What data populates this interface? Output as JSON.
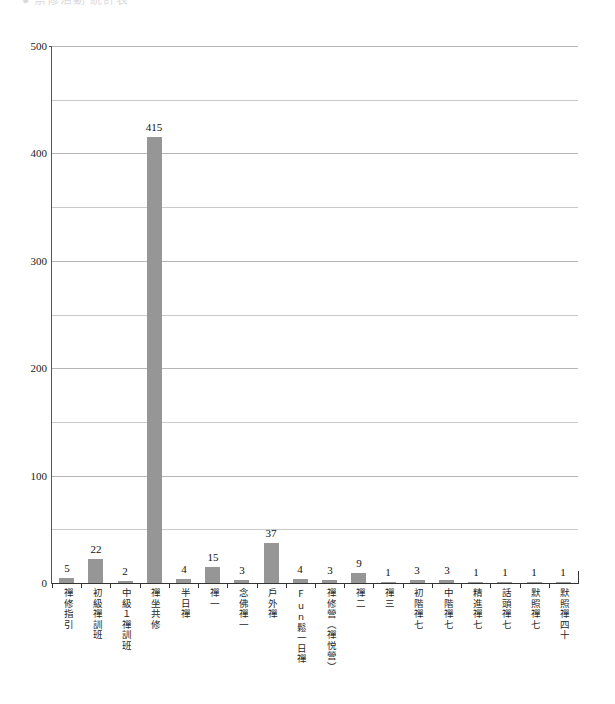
{
  "header": {
    "clipped_text": "● 禁修活動 統計表"
  },
  "chart_data": {
    "type": "bar",
    "title": "",
    "subtitle": "",
    "xlabel": "",
    "ylabel": "",
    "ylim": [
      0,
      500
    ],
    "ytick_labels": [
      "500",
      "400",
      "300",
      "200",
      "100",
      "0"
    ],
    "ytick_values": [
      500,
      400,
      300,
      200,
      100,
      0
    ],
    "gridlines_major": [
      500,
      400,
      300,
      200,
      100
    ],
    "gridlines_minor": [
      450,
      350,
      250,
      150,
      50
    ],
    "grid": true,
    "legend": false,
    "legend_position": "none",
    "bar_color": "#969696",
    "axis_color": "#333333",
    "grid_color": "#c9c9c9",
    "categories": [
      "禪修指引",
      "初級禪訓班",
      "中級１禪訓班",
      "禪坐共修",
      "半日禪",
      "禪一",
      "念佛禪一",
      "戶外禪",
      "Fun鬆一日禪",
      "禪修營（禪悦營）",
      "禪二",
      "禪三",
      "初階禪七",
      "中階禪七",
      "精進禪七",
      "話頭禪七",
      "默照禪七",
      "默照禪四十"
    ],
    "values": [
      5,
      22,
      2,
      415,
      4,
      15,
      3,
      37,
      4,
      3,
      9,
      1,
      3,
      3,
      1,
      1,
      1,
      1
    ],
    "value_labels": [
      "5",
      "22",
      "2",
      "415",
      "4",
      "15",
      "3",
      "37",
      "4",
      "3",
      "9",
      "1",
      "3",
      "3",
      "1",
      "1",
      "1",
      "1"
    ]
  }
}
